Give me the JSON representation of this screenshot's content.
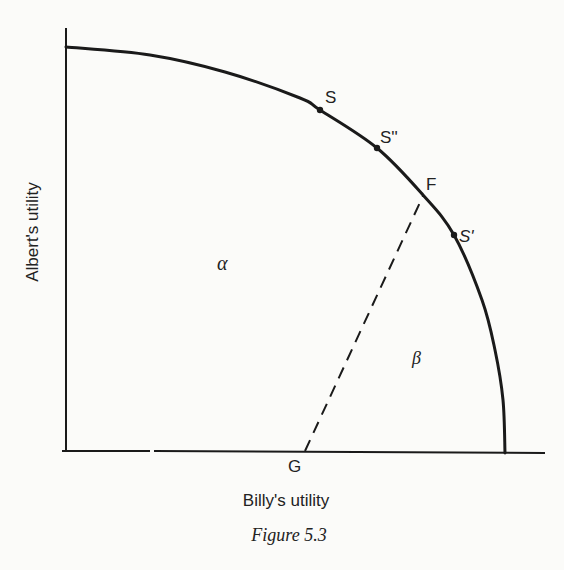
{
  "chart_data": {
    "type": "diagram",
    "title": "Figure 5.3",
    "xlabel": "Billy's utility",
    "ylabel": "Albert's utility",
    "curve": "utility possibility frontier (concave, from y-axis top to x-axis right)",
    "points": [
      {
        "label": "S",
        "position": "on frontier, upper"
      },
      {
        "label": "S''",
        "position": "on frontier, between S and F"
      },
      {
        "label": "F",
        "position": "on frontier, end of dashed line"
      },
      {
        "label": "S'",
        "position": "on frontier, below F"
      },
      {
        "label": "G",
        "position": "on Billy's utility axis"
      }
    ],
    "regions": [
      {
        "label": "α",
        "position": "left of dashed line FG"
      },
      {
        "label": "β",
        "position": "right of dashed line FG"
      }
    ],
    "lines": [
      {
        "from": "G",
        "to": "F",
        "style": "dashed"
      }
    ]
  },
  "labels": {
    "S": "S",
    "S2": "S''",
    "F": "F",
    "S1": "S'",
    "G": "G",
    "alpha": "α",
    "beta": "β",
    "xlabel": "Billy's utility",
    "ylabel": "Albert's utility",
    "caption": "Figure 5.3"
  }
}
